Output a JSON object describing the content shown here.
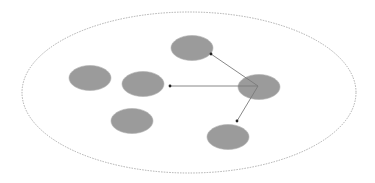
{
  "diagram": {
    "canvas": {
      "width": 375,
      "height": 183,
      "background": "#ffffff"
    },
    "boundary": {
      "cx": 189,
      "cy": 92.5,
      "rx": 167,
      "ry": 80.5,
      "stroke": "#9a9a9a",
      "dash": "1.5,1.2"
    },
    "node_style": {
      "fill": "#9b9b9b",
      "stroke": "#b0b0b0",
      "rx": 21,
      "ry": 12.5
    },
    "nodes": [
      {
        "id": "node-top",
        "cx": 192,
        "cy": 48
      },
      {
        "id": "node-far-left",
        "cx": 90,
        "cy": 78
      },
      {
        "id": "node-left",
        "cx": 143,
        "cy": 84
      },
      {
        "id": "node-source",
        "cx": 259,
        "cy": 87
      },
      {
        "id": "node-bottom-left",
        "cx": 132,
        "cy": 121
      },
      {
        "id": "node-bottom-right",
        "cx": 228,
        "cy": 137
      }
    ],
    "edge_style": {
      "stroke": "#7a7a7a",
      "width": 0.9,
      "head": "#222222"
    },
    "edges": [
      {
        "from": "node-source",
        "to": "node-top",
        "x1": 258,
        "y1": 86,
        "x2": 211,
        "y2": 54
      },
      {
        "from": "node-source",
        "to": "node-left",
        "x1": 258,
        "y1": 86,
        "x2": 170,
        "y2": 86
      },
      {
        "from": "node-source",
        "to": "node-bottom-right",
        "x1": 258,
        "y1": 86,
        "x2": 237,
        "y2": 121
      }
    ]
  }
}
